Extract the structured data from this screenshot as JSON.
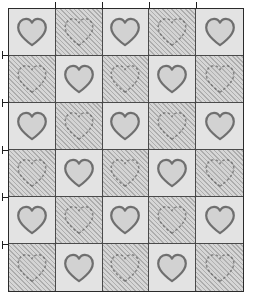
{
  "figure": {
    "name": "heart-quilt-pattern",
    "type": "checkerboard-quilt-diagram",
    "columns": 5,
    "rows": 6,
    "motif": "heart-icon",
    "frame": {
      "border_color": "#2b2b2b",
      "grid_line_color": "#4a4a4a",
      "left": 8,
      "top": 8,
      "width": 236,
      "height": 284
    },
    "colors": {
      "light_patch": "#e3e3e3",
      "hatch_base": "#c9c9c9",
      "hatch_line": "#adadad",
      "heart_fill": "#d2d2d2",
      "heart_stroke": "#6f6f6f",
      "tick_mark": "#1f1f1f",
      "page_background": "#ffffff"
    },
    "hatch_angle_degrees": 45
  },
  "grid": {
    "cells": [
      [
        {
          "patch": "light",
          "motif": "heart-icon"
        },
        {
          "patch": "hatch",
          "motif": "heart-icon"
        },
        {
          "patch": "light",
          "motif": "heart-icon"
        },
        {
          "patch": "hatch",
          "motif": "heart-icon"
        },
        {
          "patch": "light",
          "motif": "heart-icon"
        }
      ],
      [
        {
          "patch": "hatch",
          "motif": "heart-icon"
        },
        {
          "patch": "light",
          "motif": "heart-icon"
        },
        {
          "patch": "hatch",
          "motif": "heart-icon"
        },
        {
          "patch": "light",
          "motif": "heart-icon"
        },
        {
          "patch": "hatch",
          "motif": "heart-icon"
        }
      ],
      [
        {
          "patch": "light",
          "motif": "heart-icon"
        },
        {
          "patch": "hatch",
          "motif": "heart-icon"
        },
        {
          "patch": "light",
          "motif": "heart-icon"
        },
        {
          "patch": "hatch",
          "motif": "heart-icon"
        },
        {
          "patch": "light",
          "motif": "heart-icon"
        }
      ],
      [
        {
          "patch": "hatch",
          "motif": "heart-icon"
        },
        {
          "patch": "light",
          "motif": "heart-icon"
        },
        {
          "patch": "hatch",
          "motif": "heart-icon"
        },
        {
          "patch": "light",
          "motif": "heart-icon"
        },
        {
          "patch": "hatch",
          "motif": "heart-icon"
        }
      ],
      [
        {
          "patch": "light",
          "motif": "heart-icon"
        },
        {
          "patch": "hatch",
          "motif": "heart-icon"
        },
        {
          "patch": "light",
          "motif": "heart-icon"
        },
        {
          "patch": "hatch",
          "motif": "heart-icon"
        },
        {
          "patch": "light",
          "motif": "heart-icon"
        }
      ],
      [
        {
          "patch": "hatch",
          "motif": "heart-icon"
        },
        {
          "patch": "light",
          "motif": "heart-icon"
        },
        {
          "patch": "hatch",
          "motif": "heart-icon"
        },
        {
          "patch": "light",
          "motif": "heart-icon"
        },
        {
          "patch": "hatch",
          "motif": "heart-icon"
        }
      ]
    ]
  },
  "tick_marks": {
    "top": {
      "name": "column-registration-ticks",
      "count": 4,
      "at_columns": [
        1,
        2,
        3,
        4
      ]
    },
    "left": {
      "name": "row-registration-ticks",
      "count": 5,
      "at_rows": [
        1,
        2,
        3,
        4,
        5
      ]
    }
  }
}
